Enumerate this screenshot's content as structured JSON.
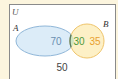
{
  "diagram": {
    "type": "venn",
    "universe_label": "U",
    "set_a_label": "A",
    "set_b_label": "B",
    "regions": {
      "a_only": "70",
      "a_and_b": "30",
      "b_only": "35",
      "outside": "50"
    },
    "colors": {
      "background": "#fcf5de",
      "universe_fill": "#ffffff",
      "universe_border": "#8a8a8a",
      "set_a_fill": "#dcecf8",
      "set_a_stroke": "#8fb6d8",
      "set_b_fill": "#fdf0c6",
      "set_b_stroke": "#efc46a",
      "intersection_fill": "#cfe6c4",
      "intersection_stroke": "#5c7a5c",
      "a_only_text": "#6a8fb0",
      "a_and_b_text": "#4f9a3c",
      "b_only_text": "#e8a030",
      "outside_text": "#444444"
    }
  }
}
